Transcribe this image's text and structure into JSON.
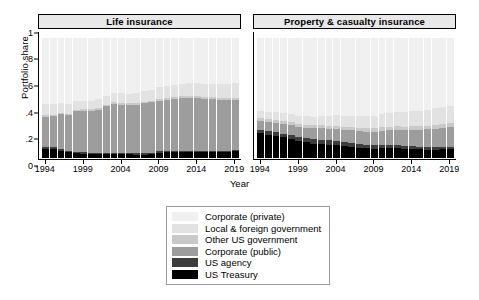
{
  "axes": {
    "ylabel": "Portfolio share",
    "xlabel": "Year",
    "yticks": [
      "0",
      ".2",
      ".4",
      ".6",
      ".8",
      "1"
    ],
    "ytick_values": [
      0,
      0.2,
      0.4,
      0.6,
      0.8,
      1
    ],
    "xticks": [
      "1994",
      "1999",
      "2004",
      "2009",
      "2014",
      "2019"
    ]
  },
  "panels": [
    {
      "title": "Life insurance"
    },
    {
      "title": "Property & casualty insurance"
    }
  ],
  "legend": {
    "items": [
      {
        "label": "Corporate (private)",
        "color": "#f0f0f0"
      },
      {
        "label": "Local & foreign government",
        "color": "#e2e2e2"
      },
      {
        "label": "Other US government",
        "color": "#c9c9c9"
      },
      {
        "label": "Corporate (public)",
        "color": "#9d9d9d"
      },
      {
        "label": "US agency",
        "color": "#3d3d3d"
      },
      {
        "label": "US Treasury",
        "color": "#000000"
      }
    ]
  },
  "chart_data": {
    "type": "bar",
    "subtype": "stacked-bar-100",
    "title": "",
    "xlabel": "Year",
    "ylabel": "Portfolio share",
    "ylim": [
      0,
      1.05
    ],
    "grid": false,
    "legend_position": "bottom-center",
    "panel_layout": "1x2",
    "x": [
      1994,
      1995,
      1996,
      1997,
      1998,
      1999,
      2000,
      2001,
      2002,
      2003,
      2004,
      2005,
      2006,
      2007,
      2008,
      2009,
      2010,
      2011,
      2012,
      2013,
      2014,
      2015,
      2016,
      2017,
      2018,
      2019
    ],
    "stack_order_bottom_to_top": [
      "US Treasury",
      "US agency",
      "Corporate (public)",
      "Other US government",
      "Local & foreign government",
      "Corporate (private)"
    ],
    "panels": [
      {
        "name": "Life insurance",
        "series": [
          {
            "name": "US Treasury",
            "values": [
              0.075,
              0.073,
              0.06,
              0.046,
              0.04,
              0.034,
              0.03,
              0.03,
              0.033,
              0.033,
              0.032,
              0.03,
              0.029,
              0.029,
              0.033,
              0.042,
              0.046,
              0.048,
              0.05,
              0.05,
              0.05,
              0.049,
              0.05,
              0.05,
              0.052,
              0.055
            ]
          },
          {
            "name": "US agency",
            "values": [
              0.016,
              0.015,
              0.014,
              0.013,
              0.013,
              0.012,
              0.012,
              0.012,
              0.013,
              0.013,
              0.013,
              0.012,
              0.011,
              0.011,
              0.012,
              0.013,
              0.012,
              0.011,
              0.01,
              0.01,
              0.01,
              0.01,
              0.01,
              0.01,
              0.01,
              0.01
            ]
          },
          {
            "name": "Corporate (public)",
            "values": [
              0.252,
              0.26,
              0.29,
              0.3,
              0.335,
              0.348,
              0.352,
              0.36,
              0.385,
              0.405,
              0.4,
              0.4,
              0.405,
              0.415,
              0.42,
              0.42,
              0.425,
              0.435,
              0.44,
              0.44,
              0.44,
              0.435,
              0.43,
              0.425,
              0.42,
              0.42
            ]
          },
          {
            "name": "Other US government",
            "values": [
              0.012,
              0.012,
              0.012,
              0.011,
              0.011,
              0.011,
              0.012,
              0.012,
              0.012,
              0.013,
              0.013,
              0.013,
              0.013,
              0.013,
              0.014,
              0.015,
              0.015,
              0.015,
              0.015,
              0.015,
              0.015,
              0.015,
              0.016,
              0.016,
              0.017,
              0.017
            ]
          },
          {
            "name": "Local & foreign government",
            "values": [
              0.095,
              0.09,
              0.085,
              0.08,
              0.075,
              0.07,
              0.072,
              0.074,
              0.075,
              0.078,
              0.08,
              0.082,
              0.085,
              0.088,
              0.092,
              0.098,
              0.1,
              0.102,
              0.105,
              0.108,
              0.11,
              0.112,
              0.115,
              0.118,
              0.12,
              0.122
            ]
          },
          {
            "name": "Corporate (private)",
            "values": [
              0.55,
              0.55,
              0.539,
              0.55,
              0.526,
              0.525,
              0.522,
              0.512,
              0.482,
              0.458,
              0.462,
              0.463,
              0.457,
              0.444,
              0.429,
              0.412,
              0.402,
              0.389,
              0.38,
              0.377,
              0.375,
              0.379,
              0.379,
              0.381,
              0.381,
              0.376
            ]
          }
        ]
      },
      {
        "name": "Property & casualty insurance",
        "series": [
          {
            "name": "US Treasury",
            "values": [
              0.205,
              0.195,
              0.185,
              0.172,
              0.16,
              0.14,
              0.13,
              0.12,
              0.118,
              0.112,
              0.108,
              0.1,
              0.092,
              0.085,
              0.08,
              0.078,
              0.082,
              0.085,
              0.082,
              0.078,
              0.075,
              0.072,
              0.07,
              0.07,
              0.072,
              0.075
            ]
          },
          {
            "name": "US agency",
            "values": [
              0.03,
              0.03,
              0.03,
              0.03,
              0.03,
              0.032,
              0.034,
              0.036,
              0.036,
              0.036,
              0.036,
              0.035,
              0.034,
              0.032,
              0.03,
              0.03,
              0.028,
              0.026,
              0.024,
              0.022,
              0.022,
              0.02,
              0.02,
              0.02,
              0.02,
              0.02
            ]
          },
          {
            "name": "Corporate (public)",
            "values": [
              0.075,
              0.078,
              0.08,
              0.082,
              0.085,
              0.088,
              0.09,
              0.092,
              0.095,
              0.098,
              0.1,
              0.102,
              0.105,
              0.108,
              0.11,
              0.112,
              0.118,
              0.122,
              0.128,
              0.132,
              0.138,
              0.142,
              0.148,
              0.152,
              0.158,
              0.162
            ]
          },
          {
            "name": "Other US government",
            "values": [
              0.022,
              0.022,
              0.022,
              0.022,
              0.022,
              0.023,
              0.023,
              0.024,
              0.024,
              0.024,
              0.025,
              0.025,
              0.026,
              0.026,
              0.027,
              0.028,
              0.028,
              0.028,
              0.029,
              0.029,
              0.03,
              0.03,
              0.03,
              0.031,
              0.031,
              0.032
            ]
          },
          {
            "name": "Local & foreign government",
            "values": [
              0.06,
              0.062,
              0.064,
              0.066,
              0.068,
              0.07,
              0.072,
              0.074,
              0.078,
              0.082,
              0.086,
              0.09,
              0.094,
              0.098,
              0.1,
              0.104,
              0.108,
              0.112,
              0.118,
              0.122,
              0.128,
              0.132,
              0.136,
              0.14,
              0.142,
              0.145
            ]
          },
          {
            "name": "Corporate (private)",
            "values": [
              0.608,
              0.613,
              0.619,
              0.628,
              0.635,
              0.647,
              0.651,
              0.654,
              0.649,
              0.648,
              0.645,
              0.648,
              0.649,
              0.651,
              0.653,
              0.648,
              0.636,
              0.627,
              0.619,
              0.617,
              0.607,
              0.604,
              0.596,
              0.587,
              0.577,
              0.566
            ]
          }
        ]
      }
    ]
  }
}
